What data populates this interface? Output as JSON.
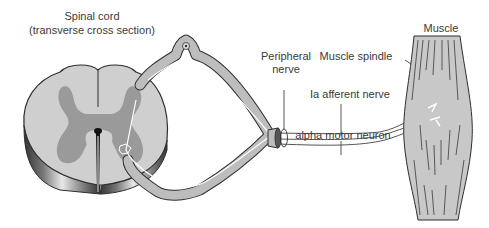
{
  "labels": {
    "spinal_cord_line1": "Spinal cord",
    "spinal_cord_line2": "(transverse cross section)",
    "peripheral_line1": "Peripheral",
    "peripheral_line2": "nerve",
    "muscle_spindle": "Muscle spindle",
    "muscle": "Muscle",
    "ia_afferent": "Ia afferent nerve",
    "alpha_motor": "alpha motor neuron"
  },
  "colors": {
    "white_matter": "#cfcfcf",
    "gray_matter": "#9a9a9a",
    "outline": "#2e2e2e",
    "nerve_fill": "#bdbdbd",
    "muscle_fill": "#c8c8c8",
    "text": "#3a3a3a"
  }
}
